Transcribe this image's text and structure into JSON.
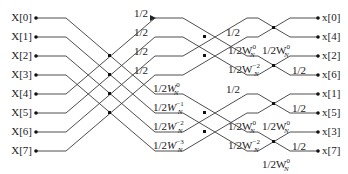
{
  "diagram": {
    "type": "butterfly-signal-flow-graph",
    "inputs": [
      "X[0]",
      "X[1]",
      "X[2]",
      "X[3]",
      "X[4]",
      "X[5]",
      "X[6]",
      "X[7]"
    ],
    "outputs": [
      "x[0]",
      "x[4]",
      "x[2]",
      "x[6]",
      "x[1]",
      "x[5]",
      "x[3]",
      "x[7]"
    ],
    "stage1_labels": [
      {
        "base": "1/2",
        "w": "",
        "exp": ""
      },
      {
        "base": "1/2",
        "w": "",
        "exp": ""
      },
      {
        "base": "1/2",
        "w": "",
        "exp": ""
      },
      {
        "base": "1/2",
        "w": "",
        "exp": ""
      },
      {
        "base": "1/2",
        "w": "W",
        "sub": "N",
        "exp": "0"
      },
      {
        "base": "1/2",
        "w": "W",
        "sub": "N",
        "exp": "−1"
      },
      {
        "base": "1/2",
        "w": "W",
        "sub": "N",
        "exp": "−2"
      },
      {
        "base": "1/2",
        "w": "W",
        "sub": "N",
        "exp": "−3"
      }
    ],
    "stage2_labels": [
      {
        "base": "1/2",
        "w": "",
        "exp": ""
      },
      {
        "base": "1/2W",
        "sub": "N",
        "exp": "0"
      },
      {
        "base": "1/2W",
        "sub": "N",
        "exp": "−2"
      },
      {
        "base": "1/2",
        "w": "",
        "exp": ""
      },
      {
        "base": "1/2W",
        "sub": "N",
        "exp": "0"
      },
      {
        "base": "1/2W",
        "sub": "N",
        "exp": "−2"
      }
    ],
    "stage3_labels": [
      {
        "base": "1/2W",
        "sub": "N",
        "exp": "0"
      },
      {
        "base": "1/2",
        "exp": ""
      },
      {
        "base": "1/2",
        "exp": ""
      },
      {
        "base": "1/2W",
        "sub": "N",
        "exp": "0"
      },
      {
        "base": "1/2",
        "exp": ""
      },
      {
        "base": "1/2W",
        "sub": "N",
        "exp": "0"
      }
    ],
    "colors": {
      "line": "#3a3a3a",
      "node": "#111111",
      "text": "#222222"
    }
  }
}
